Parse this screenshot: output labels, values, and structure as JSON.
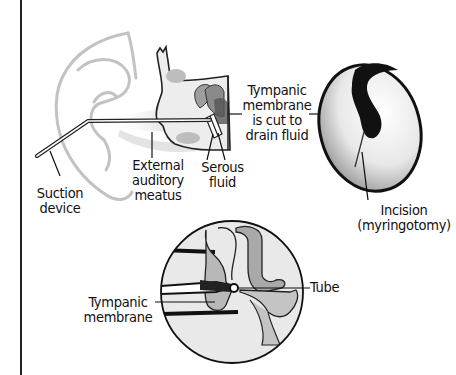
{
  "figure": {
    "topic": "Myringotomy and ear tube placement",
    "colors": {
      "ink": "#111111",
      "ear_outline": "#bdbdbd",
      "tissue_light": "#e6e6e6",
      "tissue_mid": "#b5b5b5",
      "tissue_dark": "#7a7a7a",
      "background": "#ffffff"
    }
  },
  "labels": {
    "suction_device": {
      "line1": "Suction",
      "line2": "device"
    },
    "external_auditory_meatus": {
      "line1": "External",
      "line2": "auditory",
      "line3": "meatus"
    },
    "serous_fluid": {
      "line1": "Serous",
      "line2": "fluid"
    },
    "tympanic_cut": {
      "line1": "Tympanic",
      "line2": "membrane",
      "line3": "is cut to",
      "line4": "drain fluid"
    },
    "incision": {
      "line1": "Incision",
      "line2": "(myringotomy)"
    },
    "tube": {
      "line1": "Tube"
    },
    "tympanic_membrane": {
      "line1": "Tympanic",
      "line2": "membrane"
    }
  }
}
